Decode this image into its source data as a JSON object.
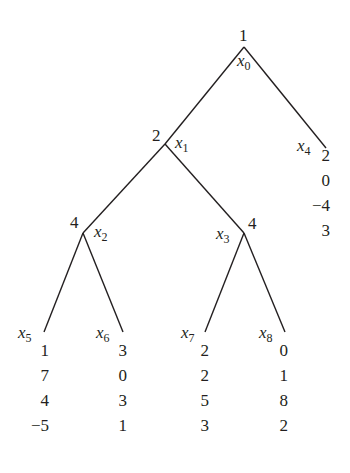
{
  "tree": {
    "nodes": [
      {
        "id": "x0",
        "label_var": "x",
        "label_sub": "0",
        "player": "1",
        "type": "decision"
      },
      {
        "id": "x1",
        "label_var": "x",
        "label_sub": "1",
        "player": "2",
        "type": "decision"
      },
      {
        "id": "x2",
        "label_var": "x",
        "label_sub": "2",
        "player": "4",
        "type": "decision"
      },
      {
        "id": "x3",
        "label_var": "x",
        "label_sub": "3",
        "player": "4",
        "type": "decision"
      },
      {
        "id": "x4",
        "label_var": "x",
        "label_sub": "4",
        "type": "terminal",
        "payoffs": [
          "2",
          "0",
          "−4",
          "3"
        ]
      },
      {
        "id": "x5",
        "label_var": "x",
        "label_sub": "5",
        "type": "terminal",
        "payoffs": [
          "1",
          "7",
          "4",
          "−5"
        ]
      },
      {
        "id": "x6",
        "label_var": "x",
        "label_sub": "6",
        "type": "terminal",
        "payoffs": [
          "3",
          "0",
          "3",
          "1"
        ]
      },
      {
        "id": "x7",
        "label_var": "x",
        "label_sub": "7",
        "type": "terminal",
        "payoffs": [
          "2",
          "2",
          "5",
          "3"
        ]
      },
      {
        "id": "x8",
        "label_var": "x",
        "label_sub": "8",
        "type": "terminal",
        "payoffs": [
          "0",
          "1",
          "8",
          "2"
        ]
      }
    ],
    "edges": [
      [
        "x0",
        "x1"
      ],
      [
        "x0",
        "x4"
      ],
      [
        "x1",
        "x2"
      ],
      [
        "x1",
        "x3"
      ],
      [
        "x2",
        "x5"
      ],
      [
        "x2",
        "x6"
      ],
      [
        "x3",
        "x7"
      ],
      [
        "x3",
        "x8"
      ]
    ]
  }
}
